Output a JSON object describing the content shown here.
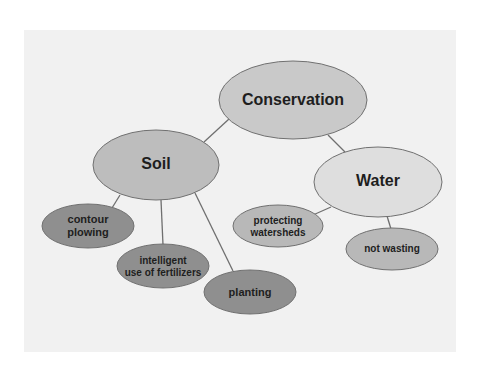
{
  "diagram": {
    "type": "concept-map",
    "colors": {
      "page_background": "#ffffff",
      "panel_background": "#f1f1f1",
      "edge": "#6f6f6f",
      "node_stroke": "#707070",
      "root_fill": "#c9c9c9",
      "soil_fill": "#bdbdbd",
      "water_fill": "#dedede",
      "soil_child_fill": "#8f8f8f",
      "water_child_fill": "#b8b8b8",
      "text": "#1e1e1e"
    },
    "nodes": {
      "conservation": {
        "label": "Conservation"
      },
      "soil": {
        "label": "Soil"
      },
      "water": {
        "label": "Water"
      },
      "contour_plowing": {
        "line1": "contour",
        "line2": "plowing"
      },
      "fertilizers": {
        "line1": "intelligent",
        "line2": "use of fertilizers"
      },
      "planting": {
        "label": "planting"
      },
      "watersheds": {
        "line1": "protecting",
        "line2": "watersheds"
      },
      "not_wasting": {
        "label": "not wasting"
      }
    },
    "edges": [
      [
        "Conservation",
        "Soil"
      ],
      [
        "Conservation",
        "Water"
      ],
      [
        "Soil",
        "contour plowing"
      ],
      [
        "Soil",
        "intelligent use of fertilizers"
      ],
      [
        "Soil",
        "planting"
      ],
      [
        "Water",
        "protecting watersheds"
      ],
      [
        "Water",
        "not wasting"
      ]
    ]
  }
}
